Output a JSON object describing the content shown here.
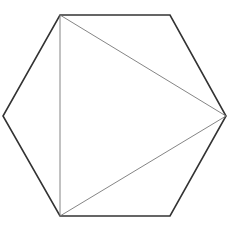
{
  "diagram": {
    "type": "geometry",
    "background": "#ffffff",
    "hexagon": {
      "stroke": "#333333",
      "stroke_width": 1.6,
      "vertices": [
        [
          60,
          15
        ],
        [
          170,
          15
        ],
        [
          226,
          116
        ],
        [
          170,
          216
        ],
        [
          60,
          216
        ],
        [
          3,
          116
        ]
      ]
    },
    "triangle": {
      "stroke": "#777777",
      "stroke_width": 0.9,
      "vertices": [
        [
          60,
          15
        ],
        [
          226,
          116
        ],
        [
          60,
          216
        ]
      ]
    }
  }
}
